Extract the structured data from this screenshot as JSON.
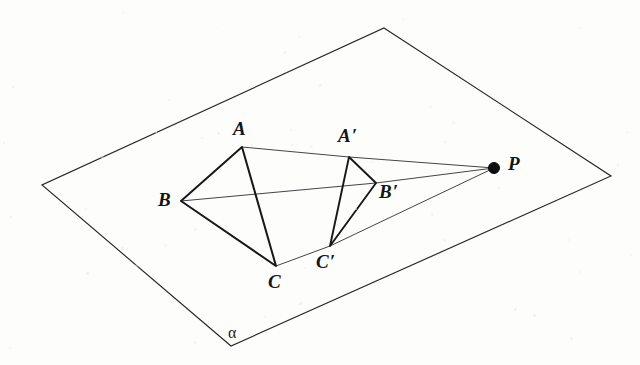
{
  "figure": {
    "kind": "geometry-diagram",
    "background_color": "#fdfdfc",
    "line_color": "#18181b",
    "ray_color": "#3a3a3f",
    "plane_edge_color": "#26262a",
    "canvas": {
      "width": 640,
      "height": 365
    }
  },
  "plane": {
    "name": "alpha",
    "label": "α",
    "label_pos": {
      "x": 228,
      "y": 325
    },
    "corners": [
      {
        "name": "top",
        "x": 384,
        "y": 28
      },
      {
        "name": "right",
        "x": 611,
        "y": 176
      },
      {
        "name": "bottom",
        "x": 231,
        "y": 346
      },
      {
        "name": "left",
        "x": 42,
        "y": 185
      }
    ]
  },
  "points": [
    {
      "id": "A",
      "label": "A",
      "prime": "",
      "x": 242,
      "y": 147,
      "label_pos": {
        "x": 233,
        "y": 119
      },
      "dot": false
    },
    {
      "id": "B",
      "label": "B",
      "prime": "",
      "x": 181,
      "y": 201,
      "label_pos": {
        "x": 158,
        "y": 190
      },
      "dot": false
    },
    {
      "id": "C",
      "label": "C",
      "prime": "",
      "x": 276,
      "y": 266,
      "label_pos": {
        "x": 268,
        "y": 272
      },
      "dot": false
    },
    {
      "id": "Ap",
      "label": "A",
      "prime": "′",
      "x": 349,
      "y": 157,
      "label_pos": {
        "x": 338,
        "y": 126
      },
      "dot": false
    },
    {
      "id": "Bp",
      "label": "B",
      "prime": "′",
      "x": 376,
      "y": 183,
      "label_pos": {
        "x": 379,
        "y": 182
      },
      "dot": false
    },
    {
      "id": "Cp",
      "label": "C",
      "prime": "′",
      "x": 330,
      "y": 246,
      "label_pos": {
        "x": 316,
        "y": 252
      },
      "dot": false
    },
    {
      "id": "P",
      "label": "P",
      "prime": "",
      "x": 494,
      "y": 168,
      "label_pos": {
        "x": 508,
        "y": 154
      },
      "dot": true
    }
  ],
  "triangles": [
    {
      "name": "triangle-ABC",
      "vertices": [
        "A",
        "B",
        "C"
      ]
    },
    {
      "name": "triangle-ApBpCp",
      "vertices": [
        "Ap",
        "Bp",
        "Cp"
      ]
    }
  ],
  "projection_rays": [
    {
      "name": "ray-P-Ap-A",
      "from": "P",
      "through": "Ap",
      "to": "A"
    },
    {
      "name": "ray-P-Bp-B",
      "from": "P",
      "through": "Bp",
      "to": "B"
    },
    {
      "name": "ray-P-Cp-C",
      "from": "P",
      "through": "Cp",
      "to": "C"
    }
  ],
  "center_of_projection": "P"
}
